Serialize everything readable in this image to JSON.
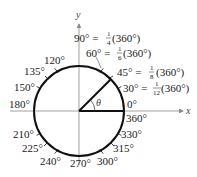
{
  "diagram": {
    "axes": {
      "x_label": "x",
      "y_label": "y"
    },
    "angle_symbol": "θ",
    "circle": {
      "cx": 79,
      "cy": 111,
      "r": 45
    },
    "terminal_side_angle_deg": 45,
    "labels": {
      "deg0": "0°",
      "deg360": "360°",
      "deg90": "90° =",
      "deg90_frac_num": "1",
      "deg90_frac_den": "4",
      "deg90_tail": "(360°)",
      "deg60": "60° =",
      "deg60_frac_num": "1",
      "deg60_frac_den": "6",
      "deg60_tail": "(360°)",
      "deg45": "45° =",
      "deg45_frac_num": "1",
      "deg45_frac_den": "8",
      "deg45_tail": "(360°)",
      "deg30": "30° =",
      "deg30_frac_num": "1",
      "deg30_frac_den": "12",
      "deg30_tail": "(360°)",
      "deg120": "120°",
      "deg135": "135°",
      "deg150": "150°",
      "deg180": "180°",
      "deg210": "210°",
      "deg225": "225°",
      "deg240": "240°",
      "deg270": "270°",
      "deg300": "300°",
      "deg315": "315°",
      "deg330": "330°"
    },
    "tick_angles_deg": [
      30,
      45,
      60,
      120,
      135,
      150,
      210,
      225,
      240,
      300,
      315,
      330
    ],
    "colors": {
      "stroke": "#111111",
      "axis": "#888888",
      "text": "#222222"
    }
  }
}
